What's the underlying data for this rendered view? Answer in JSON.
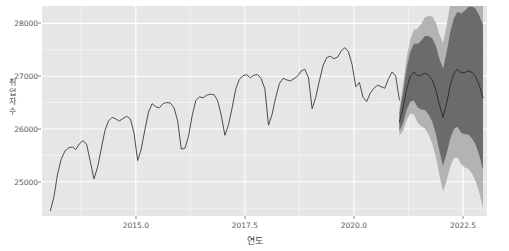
{
  "chart_data": {
    "type": "line",
    "title": "",
    "xlabel": "연도",
    "ylabel": "취업자수",
    "ylabel_chars": [
      "취",
      "업",
      "자",
      "수"
    ],
    "xlim": [
      2012.85,
      2023.05
    ],
    "ylim": [
      24350,
      28330
    ],
    "xticks": [
      2015.0,
      2017.5,
      2020.0,
      2022.5
    ],
    "xtick_labels": [
      "2015.0",
      "2017.5",
      "2020.0",
      "2022.5"
    ],
    "yticks": [
      25000,
      26000,
      27000,
      28000
    ],
    "ytick_labels": [
      "25000",
      "26000",
      "27000",
      "28000"
    ],
    "grid": true,
    "grid_color": "#ffffff",
    "panel_color": "#e6e6e6",
    "line_color": "#4d4d4d",
    "band_80_color": "#6b6b6b",
    "band_95_color": "#b3b3b3",
    "legend": "none",
    "series": [
      {
        "name": "취업자수 (관측)",
        "type": "observed",
        "x": [
          2013.042,
          2013.125,
          2013.208,
          2013.292,
          2013.375,
          2013.458,
          2013.542,
          2013.625,
          2013.708,
          2013.792,
          2013.875,
          2013.958,
          2014.042,
          2014.125,
          2014.208,
          2014.292,
          2014.375,
          2014.458,
          2014.542,
          2014.625,
          2014.708,
          2014.792,
          2014.875,
          2014.958,
          2015.042,
          2015.125,
          2015.208,
          2015.292,
          2015.375,
          2015.458,
          2015.542,
          2015.625,
          2015.708,
          2015.792,
          2015.875,
          2015.958,
          2016.042,
          2016.125,
          2016.208,
          2016.292,
          2016.375,
          2016.458,
          2016.542,
          2016.625,
          2016.708,
          2016.792,
          2016.875,
          2016.958,
          2017.042,
          2017.125,
          2017.208,
          2017.292,
          2017.375,
          2017.458,
          2017.542,
          2017.625,
          2017.708,
          2017.792,
          2017.875,
          2017.958,
          2018.042,
          2018.125,
          2018.208,
          2018.292,
          2018.375,
          2018.458,
          2018.542,
          2018.625,
          2018.708,
          2018.792,
          2018.875,
          2018.958,
          2019.042,
          2019.125,
          2019.208,
          2019.292,
          2019.375,
          2019.458,
          2019.542,
          2019.625,
          2019.708,
          2019.792,
          2019.875,
          2019.958,
          2020.042,
          2020.125,
          2020.208,
          2020.292,
          2020.375,
          2020.458,
          2020.542,
          2020.625,
          2020.708,
          2020.792,
          2020.875,
          2020.958,
          2021.042
        ],
        "values": [
          24450,
          24720,
          25150,
          25430,
          25580,
          25640,
          25660,
          25610,
          25720,
          25780,
          25700,
          25380,
          25050,
          25280,
          25620,
          25970,
          26150,
          26220,
          26190,
          26150,
          26200,
          26240,
          26190,
          25930,
          25400,
          25620,
          25980,
          26320,
          26480,
          26420,
          26400,
          26480,
          26500,
          26490,
          26400,
          26160,
          25620,
          25630,
          25860,
          26250,
          26540,
          26610,
          26590,
          26640,
          26660,
          26650,
          26540,
          26260,
          25880,
          26080,
          26400,
          26760,
          26940,
          27010,
          27030,
          26970,
          27020,
          27030,
          26950,
          26760,
          26070,
          26280,
          26600,
          26860,
          26960,
          26930,
          26910,
          26950,
          27000,
          27100,
          27130,
          26970,
          26380,
          26600,
          26910,
          27200,
          27350,
          27380,
          27330,
          27360,
          27480,
          27540,
          27460,
          27220,
          26800,
          26880,
          26600,
          26520,
          26680,
          26770,
          26830,
          26800,
          26770,
          26950,
          27080,
          27000,
          26550
        ]
      },
      {
        "name": "예측 (점추정)",
        "type": "forecast_mean",
        "x": [
          2021.042,
          2021.125,
          2021.208,
          2021.292,
          2021.375,
          2021.458,
          2021.542,
          2021.625,
          2021.708,
          2021.792,
          2021.875,
          2021.958,
          2022.042,
          2022.125,
          2022.208,
          2022.292,
          2022.375,
          2022.458,
          2022.542,
          2022.625,
          2022.708,
          2022.792,
          2022.875,
          2022.958
        ],
        "values": [
          26130,
          26400,
          26760,
          26990,
          27080,
          27010,
          27020,
          27060,
          27020,
          26930,
          26750,
          26460,
          26220,
          26490,
          26830,
          27050,
          27130,
          27060,
          27070,
          27100,
          27070,
          26990,
          26820,
          26590
        ]
      },
      {
        "name": "80% 예측구간",
        "type": "interval_80",
        "x": [
          2021.042,
          2021.125,
          2021.208,
          2021.292,
          2021.375,
          2021.458,
          2021.542,
          2021.625,
          2021.708,
          2021.792,
          2021.875,
          2021.958,
          2022.042,
          2022.125,
          2022.208,
          2022.292,
          2022.375,
          2022.458,
          2022.542,
          2022.625,
          2022.708,
          2022.792,
          2022.875,
          2022.958
        ],
        "lower": [
          25960,
          26110,
          26360,
          26520,
          26540,
          26410,
          26370,
          26360,
          26280,
          26140,
          25920,
          25590,
          25300,
          25530,
          25820,
          26000,
          26040,
          25930,
          25900,
          25890,
          25820,
          25700,
          25490,
          25220
        ],
        "upper": [
          26300,
          26690,
          27160,
          27460,
          27620,
          27610,
          27670,
          27760,
          27760,
          27720,
          27580,
          27330,
          27140,
          27450,
          27840,
          28100,
          28220,
          28190,
          28240,
          28310,
          28320,
          28280,
          28150,
          27960
        ]
      },
      {
        "name": "95% 예측구간",
        "type": "interval_95",
        "x": [
          2021.042,
          2021.125,
          2021.208,
          2021.292,
          2021.375,
          2021.458,
          2021.542,
          2021.625,
          2021.708,
          2021.792,
          2021.875,
          2021.958,
          2022.042,
          2022.125,
          2022.208,
          2022.292,
          2022.375,
          2022.458,
          2022.542,
          2022.625,
          2022.708,
          2022.792,
          2022.875,
          2022.958
        ],
        "lower": [
          25870,
          25960,
          26170,
          26290,
          26280,
          26120,
          26050,
          26010,
          25900,
          25730,
          25480,
          25130,
          24810,
          25020,
          25290,
          25450,
          25460,
          25330,
          25270,
          25240,
          25150,
          25010,
          24780,
          24490
        ],
        "upper": [
          26390,
          26840,
          27350,
          27690,
          27880,
          27900,
          27990,
          28110,
          28140,
          28130,
          28020,
          27790,
          27630,
          27960,
          28370,
          28650,
          28800,
          28790,
          28870,
          28960,
          28990,
          28970,
          28860,
          28690
        ]
      }
    ],
    "annotations": [
      {
        "text": "forecast starts at 2021.04",
        "x": 2021.042
      }
    ]
  }
}
